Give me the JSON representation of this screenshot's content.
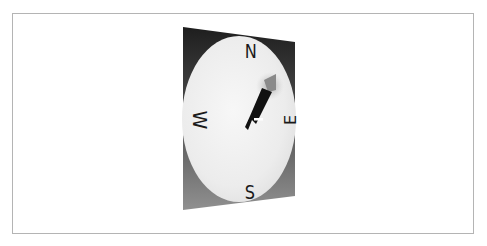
{
  "figure": {
    "type": "compass-illustration",
    "cardinal_labels": {
      "north": "N",
      "east": "E",
      "south": "S",
      "west": "W"
    },
    "needle": {
      "direction": "north-east",
      "shaft_color": "#111111",
      "tip_color": "#8a8a8a",
      "marker_color": "#ffffff"
    },
    "colors": {
      "frame_border": "#b4b4b4",
      "panel_top": "#222222",
      "panel_bottom": "#8e8e8e",
      "face": "#efefef",
      "label": "#1a1a1a"
    }
  }
}
